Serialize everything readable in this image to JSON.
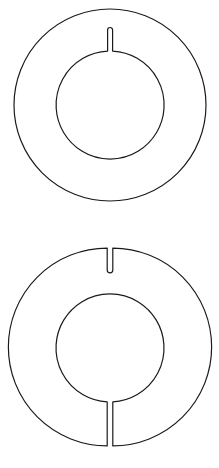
{
  "diagram": {
    "stroke_color": "#1a1a1a",
    "background": "#ffffff",
    "shapes": [
      {
        "id": "ring-top",
        "type": "annulus-with-inner-slot",
        "center": [
          110,
          106
        ],
        "outer_radius": 96,
        "inner_radius": 54,
        "slot": {
          "position": "top",
          "from": "inner",
          "width": 5,
          "length": 24
        }
      },
      {
        "id": "ring-bottom",
        "type": "split-annulus",
        "center": [
          110,
          347
        ],
        "outer_radius": 96,
        "inner_radius": 54,
        "slot": {
          "position": "top",
          "from": "outer",
          "width": 5,
          "length": 24
        },
        "cut": {
          "position": "bottom",
          "from": "inner",
          "to": "outer",
          "width": 5
        }
      }
    ]
  }
}
